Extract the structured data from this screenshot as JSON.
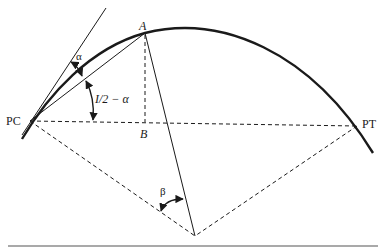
{
  "diagram": {
    "type": "circular-curve-geometry",
    "labels": {
      "pc": "PC",
      "pt": "PT",
      "point_a": "A",
      "point_b": "B",
      "angle_alpha": "α",
      "angle_half_i": "I/2 − α",
      "angle_beta": "β"
    },
    "colors": {
      "stroke": "#1a1a1a",
      "background": "#ffffff",
      "rule": "#555555"
    },
    "elements": [
      "circular arc (thick) from PC through A to PT",
      "tangent line at PC",
      "chord PC to A",
      "dashed long chord PC to PT",
      "dashed perpendicular A to B",
      "solid line from A to curve center",
      "dashed radii PC-center and PT-center",
      "angle arc alpha between tangent and chord PC-A",
      "angle arc I/2 - alpha between chord PC-A and long chord",
      "angle arc beta at radius PC-center and line A-center"
    ]
  }
}
